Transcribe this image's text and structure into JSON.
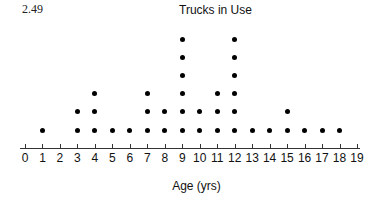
{
  "figure_number": "2.49",
  "chart_data": {
    "type": "dot plot",
    "title": "Trucks in Use",
    "xlabel": "Age (yrs)",
    "ylabel": "",
    "x_ticks": [
      0,
      1,
      2,
      3,
      4,
      5,
      6,
      7,
      8,
      9,
      10,
      11,
      12,
      13,
      14,
      15,
      16,
      17,
      18,
      19
    ],
    "xlim": [
      0,
      19
    ],
    "grid": false,
    "categories": [
      0,
      1,
      2,
      3,
      4,
      5,
      6,
      7,
      8,
      9,
      10,
      11,
      12,
      13,
      14,
      15,
      16,
      17,
      18,
      19
    ],
    "values": [
      0,
      1,
      0,
      2,
      3,
      1,
      1,
      3,
      2,
      6,
      2,
      3,
      6,
      1,
      1,
      2,
      1,
      1,
      1,
      0
    ]
  }
}
